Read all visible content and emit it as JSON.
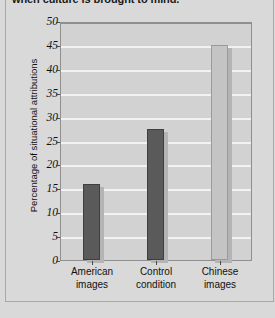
{
  "figure": {
    "caption": "when culture is brought to mind."
  },
  "colors": {
    "page_background": "#d9d9d9",
    "plot_background": "#d2d2d2",
    "gridline": "#f2f2f2",
    "bar_dark": "#5a5a5a",
    "bar_light": "#c4c4c4",
    "bar_shadow": "#b4b4b4",
    "axis": "#8f8f8f",
    "text": "#111111"
  },
  "chart_data": {
    "type": "bar",
    "title": "when culture is brought to mind.",
    "xlabel": "",
    "ylabel": "Percentage of situational attributions",
    "categories": [
      "American images",
      "Control condition",
      "Chinese images"
    ],
    "category_lines": [
      [
        "American",
        "images"
      ],
      [
        "Control",
        "condition"
      ],
      [
        "Chinese",
        "images"
      ]
    ],
    "values": [
      16,
      27.5,
      45
    ],
    "bar_colors": [
      "#5a5a5a",
      "#5a5a5a",
      "#c4c4c4"
    ],
    "ylim": [
      0,
      50
    ],
    "ytick_step": 5,
    "yticks": [
      0,
      5,
      10,
      15,
      20,
      25,
      30,
      35,
      40,
      45,
      50
    ],
    "ytick_labels": [
      "0",
      "5",
      "10",
      "15",
      "20",
      "25",
      "30",
      "35",
      "40",
      "45",
      "50"
    ],
    "grid": true,
    "grid_orientation": "horizontal",
    "legend": null
  }
}
